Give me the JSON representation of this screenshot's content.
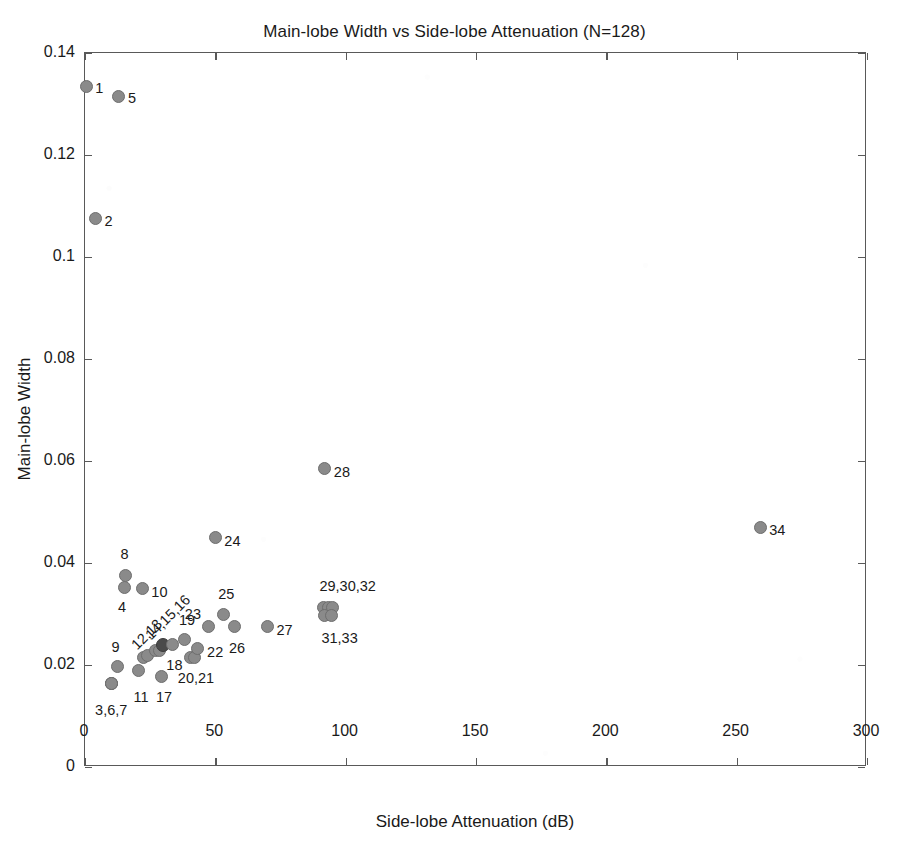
{
  "chart_data": {
    "type": "scatter",
    "title": "Main-lobe Width vs Side-lobe Attenuation (N=128)",
    "xlabel": "Side-lobe Attenuation (dB)",
    "ylabel": "Main-lobe Width",
    "xlim": [
      0,
      300
    ],
    "ylim": [
      0,
      0.14
    ],
    "xticks": [
      0,
      50,
      100,
      150,
      200,
      250,
      300
    ],
    "xticklabels": [
      "0",
      "50",
      "100",
      "150",
      "200",
      "250",
      "300"
    ],
    "yticks": [
      0,
      0.02,
      0.04,
      0.06,
      0.08,
      0.1,
      0.12,
      0.14
    ],
    "yticklabels": [
      "0",
      "0.02",
      "0.04",
      "0.06",
      "0.08",
      "0.1",
      "0.12",
      "0.14"
    ],
    "grid": false,
    "legend": null,
    "marker_color": "#8a8a8a",
    "marker_edge_color": "#6e6e6e",
    "highlight_color": "#4a4a4a",
    "points": [
      {
        "id": "1",
        "x": 0.5,
        "y": 0.1335,
        "highlight": false
      },
      {
        "id": "2",
        "x": 4.0,
        "y": 0.1075,
        "highlight": false
      },
      {
        "id": "3",
        "x": 10.0,
        "y": 0.0163,
        "highlight": false
      },
      {
        "id": "4",
        "x": 15.0,
        "y": 0.0352,
        "highlight": false
      },
      {
        "id": "5",
        "x": 13.0,
        "y": 0.1315,
        "highlight": false
      },
      {
        "id": "6",
        "x": 10.0,
        "y": 0.0163,
        "highlight": false
      },
      {
        "id": "7",
        "x": 10.0,
        "y": 0.0163,
        "highlight": false
      },
      {
        "id": "8",
        "x": 15.5,
        "y": 0.0375,
        "highlight": false
      },
      {
        "id": "9",
        "x": 12.5,
        "y": 0.0198,
        "highlight": false
      },
      {
        "id": "10",
        "x": 22.0,
        "y": 0.035,
        "highlight": false
      },
      {
        "id": "11",
        "x": 20.5,
        "y": 0.019,
        "highlight": false
      },
      {
        "id": "12",
        "x": 22.5,
        "y": 0.0215,
        "highlight": false
      },
      {
        "id": "13",
        "x": 24.0,
        "y": 0.0218,
        "highlight": false
      },
      {
        "id": "14",
        "x": 27.0,
        "y": 0.0228,
        "highlight": false
      },
      {
        "id": "15",
        "x": 28.5,
        "y": 0.0228,
        "highlight": false
      },
      {
        "id": "16",
        "x": 30.0,
        "y": 0.024,
        "highlight": true
      },
      {
        "id": "17",
        "x": 29.5,
        "y": 0.0178,
        "highlight": false
      },
      {
        "id": "18",
        "x": 33.5,
        "y": 0.024,
        "highlight": false
      },
      {
        "id": "19",
        "x": 38.0,
        "y": 0.025,
        "highlight": false
      },
      {
        "id": "20",
        "x": 40.5,
        "y": 0.0215,
        "highlight": false
      },
      {
        "id": "21",
        "x": 42.0,
        "y": 0.0215,
        "highlight": false
      },
      {
        "id": "22",
        "x": 43.0,
        "y": 0.0232,
        "highlight": false
      },
      {
        "id": "23",
        "x": 47.5,
        "y": 0.0275,
        "highlight": false
      },
      {
        "id": "24",
        "x": 50.0,
        "y": 0.045,
        "highlight": false
      },
      {
        "id": "25",
        "x": 53.0,
        "y": 0.03,
        "highlight": false
      },
      {
        "id": "26",
        "x": 57.5,
        "y": 0.0275,
        "highlight": false
      },
      {
        "id": "27",
        "x": 70.0,
        "y": 0.0275,
        "highlight": false
      },
      {
        "id": "28",
        "x": 92.0,
        "y": 0.0585,
        "highlight": false
      },
      {
        "id": "29",
        "x": 91.5,
        "y": 0.0313,
        "highlight": false
      },
      {
        "id": "30",
        "x": 93.5,
        "y": 0.0313,
        "highlight": false
      },
      {
        "id": "31",
        "x": 92.0,
        "y": 0.0298,
        "highlight": false
      },
      {
        "id": "32",
        "x": 95.0,
        "y": 0.0313,
        "highlight": false
      },
      {
        "id": "33",
        "x": 94.5,
        "y": 0.0298,
        "highlight": false
      },
      {
        "id": "34",
        "x": 259.0,
        "y": 0.047,
        "highlight": false
      }
    ],
    "annotations": [
      {
        "text": "1",
        "x": 0.5,
        "y": 0.1335,
        "dx": 9,
        "dy": 2,
        "rotated": false
      },
      {
        "text": "5",
        "x": 13.0,
        "y": 0.1315,
        "dx": 9,
        "dy": 2,
        "rotated": false
      },
      {
        "text": "2",
        "x": 4.0,
        "y": 0.1075,
        "dx": 9,
        "dy": 2,
        "rotated": false
      },
      {
        "text": "8",
        "x": 15.5,
        "y": 0.0375,
        "dx": -5,
        "dy": -22,
        "rotated": false
      },
      {
        "text": "4",
        "x": 15.0,
        "y": 0.0352,
        "dx": -6,
        "dy": 20,
        "rotated": false
      },
      {
        "text": "10",
        "x": 22.0,
        "y": 0.035,
        "dx": 9,
        "dy": 3,
        "rotated": false
      },
      {
        "text": "9",
        "x": 12.5,
        "y": 0.0198,
        "dx": -6,
        "dy": -19,
        "rotated": false
      },
      {
        "text": "12,13",
        "x": 22.0,
        "y": 0.0225,
        "dx": -8,
        "dy": -5,
        "rotated": true
      },
      {
        "text": "14,15,16",
        "x": 26.5,
        "y": 0.0245,
        "dx": -6,
        "dy": -5,
        "rotated": true
      },
      {
        "text": "11",
        "x": 20.5,
        "y": 0.019,
        "dx": -5,
        "dy": 27,
        "rotated": false
      },
      {
        "text": "17",
        "x": 29.5,
        "y": 0.0178,
        "dx": -6,
        "dy": 21,
        "rotated": false
      },
      {
        "text": "18",
        "x": 33.5,
        "y": 0.024,
        "dx": -6,
        "dy": 20,
        "rotated": false
      },
      {
        "text": "19",
        "x": 38.0,
        "y": 0.025,
        "dx": -5,
        "dy": -20,
        "rotated": false
      },
      {
        "text": "20,21",
        "x": 41.0,
        "y": 0.0215,
        "dx": -14,
        "dy": 21,
        "rotated": false
      },
      {
        "text": "22",
        "x": 43.0,
        "y": 0.0232,
        "dx": 10,
        "dy": 3,
        "rotated": false
      },
      {
        "text": "23",
        "x": 47.5,
        "y": 0.0275,
        "dx": -24,
        "dy": -13,
        "rotated": false
      },
      {
        "text": "24",
        "x": 50.0,
        "y": 0.045,
        "dx": 9,
        "dy": 3,
        "rotated": false
      },
      {
        "text": "25",
        "x": 53.0,
        "y": 0.03,
        "dx": -5,
        "dy": -20,
        "rotated": false
      },
      {
        "text": "26",
        "x": 57.5,
        "y": 0.0275,
        "dx": -6,
        "dy": 21,
        "rotated": false
      },
      {
        "text": "27",
        "x": 70.0,
        "y": 0.0275,
        "dx": 9,
        "dy": 3,
        "rotated": false
      },
      {
        "text": "28",
        "x": 92.0,
        "y": 0.0585,
        "dx": 9,
        "dy": 3,
        "rotated": false
      },
      {
        "text": "29,30,32",
        "x": 93.0,
        "y": 0.0313,
        "dx": -8,
        "dy": -21,
        "rotated": false
      },
      {
        "text": "31,33",
        "x": 93.0,
        "y": 0.0298,
        "dx": -6,
        "dy": 23,
        "rotated": false
      },
      {
        "text": "3,6,7",
        "x": 10.0,
        "y": 0.0163,
        "dx": -16,
        "dy": 26,
        "rotated": false
      },
      {
        "text": "34",
        "x": 259.0,
        "y": 0.047,
        "dx": 9,
        "dy": 3,
        "rotated": false
      }
    ]
  }
}
